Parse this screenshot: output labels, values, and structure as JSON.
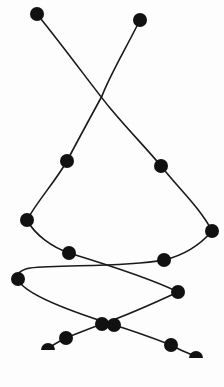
{
  "diagram": {
    "type": "braided-chain",
    "background": "#ffffff",
    "stroke_color": "#1a1a1a",
    "node_color": "#111111",
    "node_radius": 7,
    "strands": [
      {
        "name": "strand-a",
        "path": "M37,14 C70,55 95,90 110,108 C130,132 148,150 161,166 C180,190 200,208 212,231 C200,245 185,255 164,260 C120,268 60,264 30,268 C20,270 16,274 18,279 C22,292 60,308 114,325 C140,333 158,340 171,345 C180,350 188,353 196,357",
        "nodes": [
          {
            "x": 37,
            "y": 14
          },
          {
            "x": 161,
            "y": 166
          },
          {
            "x": 212,
            "y": 231
          },
          {
            "x": 164,
            "y": 260
          },
          {
            "x": 18,
            "y": 279
          },
          {
            "x": 114,
            "y": 325
          },
          {
            "x": 171,
            "y": 345
          }
        ],
        "end_half_node": {
          "x": 196,
          "y": 358
        }
      },
      {
        "name": "strand-b",
        "path": "M140,20 C125,50 110,75 102,96 C90,118 78,140 67,161 C55,182 38,200 27,220 C35,235 52,247 69,253 C105,264 150,278 178,292 C150,305 125,316 102,324 C88,329 76,334 66,338 C58,342 52,345 48,349",
        "nodes": [
          {
            "x": 140,
            "y": 20
          },
          {
            "x": 67,
            "y": 161
          },
          {
            "x": 27,
            "y": 220
          },
          {
            "x": 69,
            "y": 253
          },
          {
            "x": 178,
            "y": 292
          },
          {
            "x": 102,
            "y": 324
          },
          {
            "x": 66,
            "y": 338
          }
        ],
        "end_half_node": {
          "x": 48,
          "y": 350
        }
      }
    ],
    "crossings": [
      {
        "x": 102,
        "y": 96
      },
      {
        "x": 128,
        "y": 266
      },
      {
        "x": 108,
        "y": 324
      }
    ]
  }
}
